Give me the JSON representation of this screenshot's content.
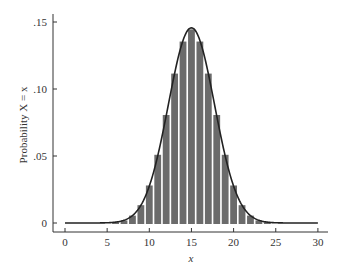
{
  "chart_data": {
    "type": "bar",
    "title": "",
    "xlabel": "x",
    "ylabel": "Probability X = x",
    "xlim": [
      -1.5,
      31
    ],
    "ylim": [
      0,
      0.155
    ],
    "x_ticks": [
      0,
      5,
      10,
      15,
      20,
      25,
      30
    ],
    "x_tick_labels": [
      "0",
      "5",
      "10",
      "15",
      "20",
      "25",
      "30"
    ],
    "y_ticks": [
      0,
      0.05,
      0.1,
      0.15
    ],
    "y_tick_labels": [
      "0",
      ".05",
      ".10",
      ".15"
    ],
    "grid": false,
    "legend": null,
    "bar_color": "#6b6b6b",
    "curve_color": "#222222",
    "categories": [
      0,
      1,
      2,
      3,
      4,
      5,
      6,
      7,
      8,
      9,
      10,
      11,
      12,
      13,
      14,
      15,
      16,
      17,
      18,
      19,
      20,
      21,
      22,
      23,
      24,
      25,
      26,
      27,
      28,
      29,
      30
    ],
    "values": [
      0.0,
      0.0,
      0.0,
      0.0,
      0.0,
      0.0001,
      0.0006,
      0.0019,
      0.0055,
      0.0133,
      0.028,
      0.0509,
      0.0806,
      0.1115,
      0.1354,
      0.1445,
      0.1354,
      0.1115,
      0.0806,
      0.0509,
      0.028,
      0.0133,
      0.0055,
      0.0019,
      0.0006,
      0.0001,
      0.0,
      0.0,
      0.0,
      0.0,
      0.0
    ],
    "overlay": {
      "type": "line",
      "name": "normal approximation",
      "mean": 15,
      "sd": 2.7386,
      "x_range": [
        0,
        30
      ]
    }
  }
}
